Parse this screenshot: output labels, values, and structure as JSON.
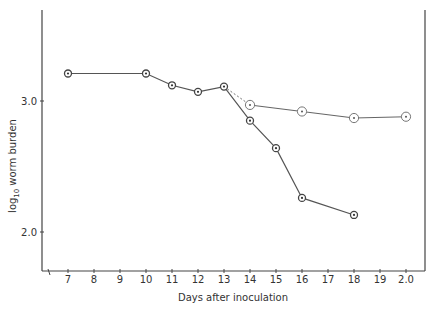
{
  "chart_data": {
    "type": "line",
    "title": "",
    "xlabel": "Days after inoculation",
    "ylabel": "log10 worm burden",
    "x_ticks": [
      "7",
      "8",
      "9",
      "10",
      "11",
      "12",
      "13",
      "14",
      "15",
      "16",
      "17",
      "18",
      "19",
      "2.0"
    ],
    "y_ticks": [
      "2.0",
      "3.0"
    ],
    "xlim": [
      6,
      21
    ],
    "ylim": [
      1.65,
      3.7
    ],
    "grid": false,
    "legend": null,
    "series": [
      {
        "name": "Declining group (filled-centre markers)",
        "x": [
          7,
          10,
          11,
          12,
          13,
          14,
          15,
          16,
          18
        ],
        "y": [
          3.21,
          3.21,
          3.12,
          3.07,
          3.11,
          2.85,
          2.64,
          2.26,
          2.13
        ],
        "line_style": "solid"
      },
      {
        "name": "Stable group (open-circle markers)",
        "x": [
          13,
          14,
          16,
          18,
          20
        ],
        "y": [
          3.11,
          2.97,
          2.92,
          2.87,
          2.88
        ],
        "line_style": "dashed 13→14, solid thereafter"
      }
    ]
  },
  "axis": {
    "xlabel": "Days after inoculation",
    "ylabel_main": "log",
    "ylabel_sub": "10",
    "ylabel_rest": "worm burden",
    "y_tick_labels": [
      "3.0",
      "2.0"
    ],
    "x_tick_labels": [
      "7",
      "8",
      "9",
      "10",
      "11",
      "12",
      "13",
      "14",
      "15",
      "16",
      "17",
      "18",
      "19",
      "2.0"
    ]
  }
}
